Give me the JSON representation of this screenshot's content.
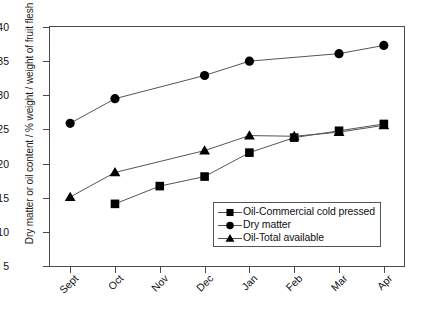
{
  "chart_data": {
    "type": "line",
    "title": "",
    "subtitle": "",
    "xlabel": "",
    "ylabel": "Dry matter or oil content / % weight / weight of fruit flesh",
    "categories": [
      "Sept",
      "Oct",
      "Nov",
      "Dec",
      "Jan",
      "Feb",
      "Mar",
      "Apr"
    ],
    "x": [
      0,
      1,
      2,
      3,
      4,
      5,
      6,
      7
    ],
    "xlim": [
      -0.45,
      7.45
    ],
    "ylim": [
      5,
      40
    ],
    "yticks": [
      5,
      10,
      15,
      20,
      25,
      30,
      35,
      40
    ],
    "ytick_labels": [
      "5",
      "10",
      "15",
      "20",
      "25",
      "30",
      "35",
      "40"
    ],
    "grid": false,
    "legend_position": "lower right (inside axes)",
    "series": [
      {
        "name": "Oil-Commercial cold pressed",
        "marker": "square",
        "color": "#000000",
        "values": [
          null,
          14.1,
          16.7,
          18.1,
          21.6,
          23.8,
          24.8,
          25.8
        ]
      },
      {
        "name": "Dry matter",
        "marker": "circle",
        "color": "#000000",
        "values": [
          25.9,
          29.5,
          null,
          32.9,
          35.0,
          null,
          36.1,
          37.3
        ]
      },
      {
        "name": "Oil-Total available",
        "marker": "triangle",
        "color": "#000000",
        "values": [
          15.1,
          18.7,
          null,
          21.9,
          24.1,
          24.0,
          24.6,
          25.6
        ]
      }
    ]
  },
  "legend": {
    "items": [
      {
        "label": "Oil-Commercial cold pressed",
        "marker": "square"
      },
      {
        "label": "Dry matter",
        "marker": "circle"
      },
      {
        "label": "Oil-Total available",
        "marker": "triangle"
      }
    ]
  },
  "colors": {
    "axis": "#4a4a4a",
    "line": "#555555",
    "marker": "#000000",
    "text": "#111111",
    "background": "#ffffff"
  }
}
